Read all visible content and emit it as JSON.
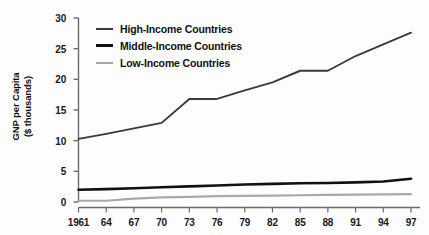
{
  "chart_data": {
    "type": "line",
    "title": "",
    "xlabel": "",
    "ylabel": "GNP per Capita ($ thousands)",
    "ylabel_line1": "GNP per Capita",
    "ylabel_line2": "($ thousands)",
    "x": [
      1961,
      1964,
      1967,
      1970,
      1973,
      1976,
      1979,
      1982,
      1985,
      1988,
      1991,
      1994,
      1997
    ],
    "xtick_labels": [
      "1961",
      "64",
      "67",
      "70",
      "73",
      "76",
      "79",
      "82",
      "85",
      "88",
      "91",
      "94",
      "97"
    ],
    "ytick_labels": [
      "0",
      "5",
      "10",
      "15",
      "20",
      "25",
      "30"
    ],
    "ytick_values": [
      0,
      5,
      10,
      15,
      20,
      25,
      30
    ],
    "ylim": [
      0,
      30
    ],
    "xlim": [
      1961,
      1997
    ],
    "grid": false,
    "legend_position": "upper-left-inside",
    "series": [
      {
        "name": "High-Income Countries",
        "color": "#3a3a3a",
        "width": 1.9,
        "values": [
          10.3,
          11.1,
          12.0,
          12.9,
          16.8,
          16.8,
          18.2,
          19.5,
          21.4,
          21.4,
          23.8,
          25.7,
          27.6
        ]
      },
      {
        "name": "Middle-Income Countries",
        "color": "#111111",
        "width": 2.6,
        "values": [
          2.0,
          2.1,
          2.25,
          2.4,
          2.55,
          2.7,
          2.85,
          2.95,
          3.05,
          3.1,
          3.2,
          3.35,
          3.8
        ]
      },
      {
        "name": "Low-Income Countries",
        "color": "#a8a8a8",
        "width": 2.2,
        "values": [
          0.2,
          0.2,
          0.55,
          0.75,
          0.85,
          0.95,
          1.0,
          1.05,
          1.1,
          1.15,
          1.2,
          1.25,
          1.3
        ]
      }
    ]
  },
  "legend": {
    "items": [
      {
        "label": "High-Income Countries",
        "color": "#3a3a3a",
        "thickness": "2px"
      },
      {
        "label": "Middle-Income Countries",
        "color": "#111111",
        "thickness": "3px"
      },
      {
        "label": "Low-Income Countries",
        "color": "#a8a8a8",
        "thickness": "2.5px"
      }
    ]
  },
  "axis": {
    "line_color": "#6a6a6a",
    "tick_color": "#6a6a6a"
  }
}
